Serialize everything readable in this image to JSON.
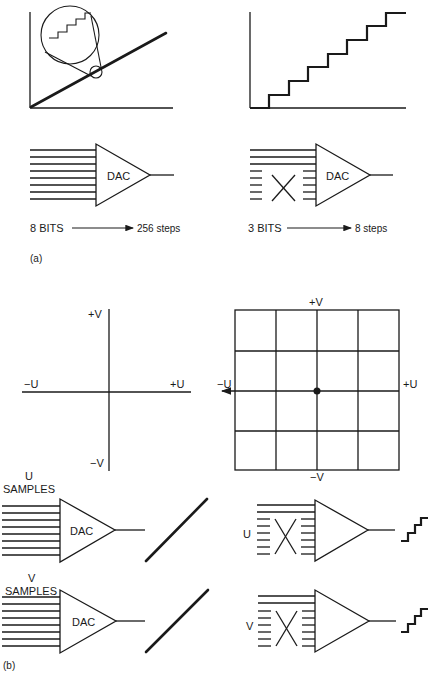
{
  "figure": {
    "part_a": {
      "panel_label": "(a)",
      "left": {
        "dac_label": "DAC",
        "bits_label": "8 BITS",
        "steps_label": "256 steps",
        "input_lines": 8,
        "graph": "smooth ramp with magnified circle showing fine steps"
      },
      "right": {
        "dac_label": "DAC",
        "bits_label": "3 BITS",
        "steps_label": "8 steps",
        "input_lines_connected": 3,
        "input_lines_disconnected": 5,
        "graph": "coarse staircase with 8 steps"
      }
    },
    "part_b": {
      "panel_label": "(b)",
      "axes_plain": {
        "plus_v": "+V",
        "minus_v": "−V",
        "plus_u": "+U",
        "minus_u": "−U"
      },
      "axes_grid": {
        "plus_v": "+V",
        "minus_v": "−V",
        "plus_u": "+U",
        "minus_u": "−U",
        "grid_cells": "4x4"
      },
      "left_dacs": [
        {
          "samples_label_line1": "U",
          "samples_label_line2": "SAMPLES",
          "dac_label": "DAC",
          "output": "smooth ramp"
        },
        {
          "samples_label_line1": "V",
          "samples_label_line2": "SAMPLES",
          "dac_label": "DAC",
          "output": "smooth ramp"
        }
      ],
      "right_dacs": [
        {
          "channel_label": "U",
          "output": "coarse staircase"
        },
        {
          "channel_label": "V",
          "output": "coarse staircase"
        }
      ]
    }
  }
}
